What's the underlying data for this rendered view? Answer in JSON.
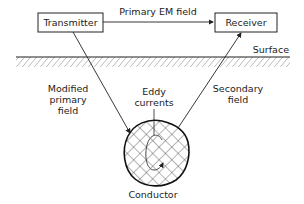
{
  "diagram": {
    "title": "",
    "nodes": {
      "transmitter": {
        "label": "Transmitter"
      },
      "receiver": {
        "label": "Receiver"
      },
      "conductor": {
        "label": "Conductor"
      }
    },
    "labels": {
      "primary_em_field": "Primary EM field",
      "surface": "Surface",
      "modified_line1": "Modified",
      "modified_line2": "primary",
      "modified_line3": "field",
      "eddy_line1": "Eddy",
      "eddy_line2": "currents",
      "secondary_line1": "Secondary",
      "secondary_line2": "field"
    },
    "edges": [
      {
        "from": "transmitter",
        "to": "receiver",
        "label": "Primary EM field"
      },
      {
        "from": "transmitter",
        "to": "conductor",
        "label": "Modified primary field"
      },
      {
        "from": "conductor",
        "to": "receiver",
        "label": "Secondary field"
      }
    ],
    "colors": {
      "stroke": "#222222",
      "hatch": "#555555",
      "background": "#ffffff"
    }
  }
}
